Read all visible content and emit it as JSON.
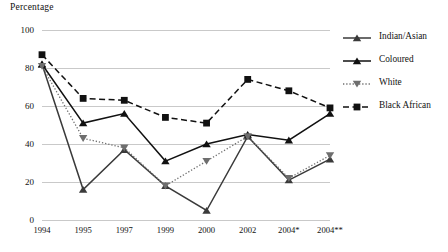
{
  "chart_data": {
    "type": "line",
    "title": "",
    "ylabel": "Percentage",
    "xlabel": "",
    "ylim": [
      0,
      100
    ],
    "yticks": [
      0,
      20,
      40,
      60,
      80,
      100
    ],
    "grid": true,
    "legend_position": "right",
    "categories": [
      "1994",
      "1995",
      "1997",
      "1999",
      "2000",
      "2002",
      "2004*",
      "2004**"
    ],
    "series": [
      {
        "name": "Indian/Asian",
        "marker": "triangle-up",
        "linestyle": "solid",
        "color": "#3a3a3a",
        "values": [
          82,
          16,
          37,
          18,
          5,
          44,
          21,
          32
        ]
      },
      {
        "name": "Coloured",
        "marker": "triangle-up",
        "linestyle": "solid",
        "color": "#111111",
        "values": [
          82,
          51,
          56,
          31,
          40,
          45,
          42,
          56
        ]
      },
      {
        "name": "White",
        "marker": "triangle-down",
        "linestyle": "dotted",
        "color": "#6e6e6e",
        "values": [
          81,
          43,
          38,
          18,
          31,
          44,
          22,
          34
        ]
      },
      {
        "name": "Black African",
        "marker": "square",
        "linestyle": "dashed",
        "color": "#111111",
        "values": [
          87,
          64,
          63,
          54,
          51,
          74,
          68,
          59
        ]
      }
    ]
  }
}
